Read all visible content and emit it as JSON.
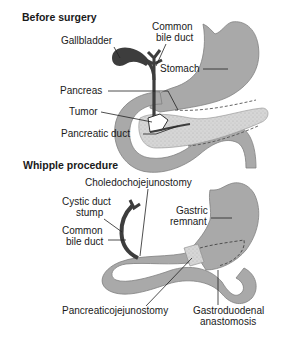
{
  "colors": {
    "background": "#ffffff",
    "organ": "#a9a9a9",
    "organ_stroke": "#7a7a7a",
    "pancreas": "#d4d4d4",
    "duct": "#3d3d3d",
    "text": "#1a1a1a",
    "leader": "#222222"
  },
  "before": {
    "title": "Before surgery",
    "labels": {
      "gallbladder": "Gallbladder",
      "common_bile_duct_1": "Common",
      "common_bile_duct_2": "bile duct",
      "stomach": "Stomach",
      "pancreas": "Pancreas",
      "tumor": "Tumor",
      "pancreatic_duct": "Pancreatic duct"
    }
  },
  "after": {
    "title": "Whipple procedure",
    "labels": {
      "choledochojejunostomy": "Choledochojejunostomy",
      "cystic_duct_stump_1": "Cystic duct",
      "cystic_duct_stump_2": "stump",
      "common_bile_duct_1": "Common",
      "common_bile_duct_2": "bile duct",
      "gastric_remnant_1": "Gastric",
      "gastric_remnant_2": "remnant",
      "pancreaticojejunostomy": "Pancreaticojejunostomy",
      "gastroduodenal_1": "Gastroduodenal",
      "gastroduodenal_2": "anastomosis"
    }
  }
}
